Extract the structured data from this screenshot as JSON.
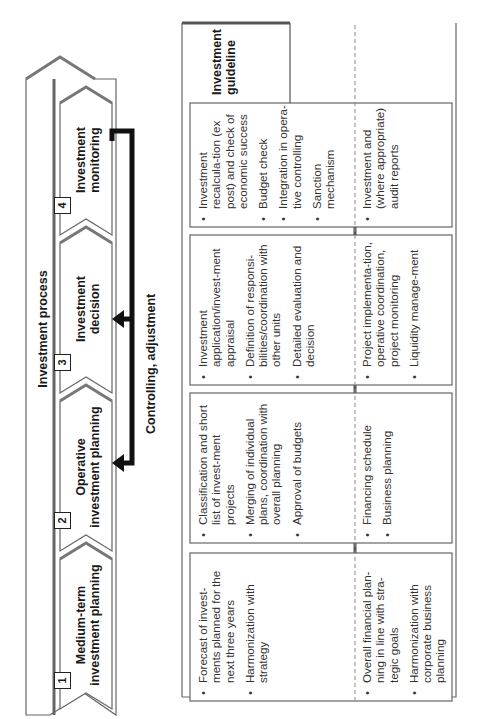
{
  "diagram": {
    "process_title": "Investment process",
    "control_label": "Controlling, adjustment",
    "guideline_label_line1": "Investment",
    "guideline_label_line2": "guideline",
    "stages": [
      {
        "number": "1",
        "line1": "Medium-term",
        "line2": "investment planning"
      },
      {
        "number": "2",
        "line1": "Operative",
        "line2": "investment planning"
      },
      {
        "number": "3",
        "line1": "Investment",
        "line2": "decision"
      },
      {
        "number": "4",
        "line1": "Investment",
        "line2": "monitoring"
      }
    ],
    "columns": [
      {
        "upper": [
          "Forecast of invest-ments planned for the next three years",
          "Harmonization with strategy"
        ],
        "lower": [
          "Overall financial plan-ning in line with stra-tegic goals",
          "Harmonization with corporate business planning"
        ]
      },
      {
        "upper": [
          "Classification and short list of invest-ment projects",
          "Merging of individual plans, coordination with overall planning",
          "Approval of budgets"
        ],
        "lower": [
          "Financing schedule",
          "Business planning"
        ]
      },
      {
        "upper": [
          "Investment application/invest-ment appraisal",
          "Definition of responsi-bilities/coordination with other units",
          "Detailed evaluation and decision"
        ],
        "lower": [
          "Project implementa-tion, operative coordination, project monitoring",
          "Liquidity manage-ment"
        ]
      },
      {
        "upper": [
          "Investment recalcula-tion (ex post) and check of economic success",
          "Budget check",
          "Integration in opera-tive controlling",
          "Sanction mechanism"
        ],
        "lower": [
          "Investment and (where appropriate) audit reports"
        ]
      }
    ],
    "colors": {
      "line": "#555555",
      "shadow": "#777777",
      "arrow": "#111111",
      "text": "#1a1a1a"
    }
  }
}
